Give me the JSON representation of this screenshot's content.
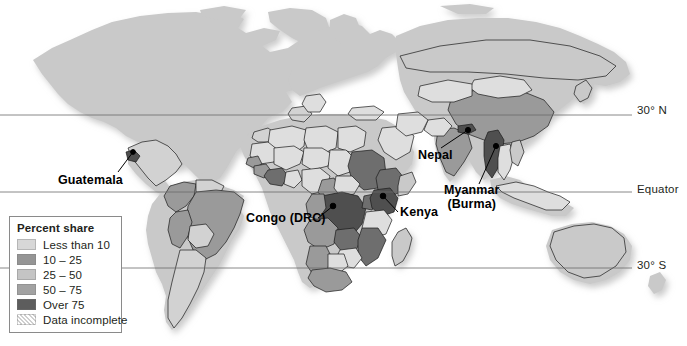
{
  "figure": {
    "type": "choropleth-world-map",
    "background_color": "#ffffff"
  },
  "latitude_lines": [
    {
      "id": "lat-30n",
      "label": "30° N",
      "y": 115
    },
    {
      "id": "lat-equator",
      "label": "Equator",
      "y": 192
    },
    {
      "id": "lat-30s",
      "label": "30° S",
      "y": 268
    }
  ],
  "callouts": [
    {
      "id": "guatemala",
      "label": "Guatemala",
      "point_x": 131,
      "point_y": 155
    },
    {
      "id": "congo",
      "label": "Congo (DRC)",
      "point_x": 331,
      "point_y": 205
    },
    {
      "id": "kenya",
      "label": "Kenya",
      "point_x": 383,
      "point_y": 193
    },
    {
      "id": "nepal",
      "label": "Nepal",
      "point_x": 470,
      "point_y": 131
    },
    {
      "id": "myanmar-line1",
      "label": "Myanmar",
      "point_x": 497,
      "point_y": 145
    },
    {
      "id": "myanmar-line2",
      "label": "(Burma)"
    }
  ],
  "legend": {
    "title": "Percent share",
    "items": [
      {
        "label": "Less than 10",
        "color": "#d7d7d7",
        "pattern": "solid"
      },
      {
        "label": "10 – 25",
        "color": "#959595",
        "pattern": "solid"
      },
      {
        "label": "25 – 50",
        "color": "#c4c4c4",
        "pattern": "solid"
      },
      {
        "label": "50 – 75",
        "color": "#a2a2a2",
        "pattern": "solid"
      },
      {
        "label": "Over 75",
        "color": "#5d5d5d",
        "pattern": "solid"
      },
      {
        "label": "Data incomplete",
        "color": "#e8e8e8",
        "pattern": "hatched"
      }
    ]
  },
  "map_colors": {
    "unshaded_land": "#c9c9c9",
    "very_light": "#dedede",
    "light": "#d2d2d2",
    "mid_light": "#bdbdbd",
    "mid": "#9a9a9a",
    "mid_dark": "#8a8a8a",
    "dark": "#6e6e6e",
    "darkest": "#4f4f4f",
    "border_stroke": "#1a1a1a",
    "graticule_stroke": "#6b6b6b",
    "shadow": "#e3e3e3"
  }
}
